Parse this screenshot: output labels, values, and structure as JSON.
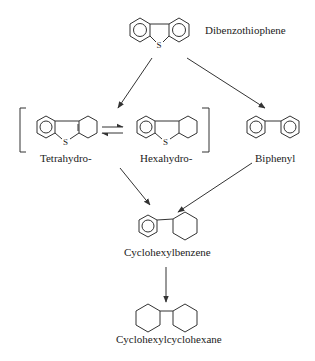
{
  "diagram": {
    "type": "reaction-pathway",
    "compounds": [
      {
        "id": "dbt",
        "label": "Dibenzothiophene"
      },
      {
        "id": "tetrahydro",
        "label": "Tetrahydro-"
      },
      {
        "id": "hexahydro",
        "label": "Hexahydro-"
      },
      {
        "id": "biphenyl",
        "label": "Biphenyl"
      },
      {
        "id": "chb",
        "label": "Cyclohexylbenzene"
      },
      {
        "id": "chch",
        "label": "Cyclohexylcyclohexane"
      }
    ],
    "atom_label": "S",
    "edges": [
      {
        "from": "dbt",
        "to": "tetrahydro-hexahydro-group",
        "type": "arrow"
      },
      {
        "from": "dbt",
        "to": "biphenyl",
        "type": "arrow"
      },
      {
        "from": "tetrahydro",
        "to": "hexahydro",
        "type": "equilibrium"
      },
      {
        "from": "tetrahydro-hexahydro-group",
        "to": "chb",
        "type": "arrow"
      },
      {
        "from": "biphenyl",
        "to": "chb",
        "type": "arrow"
      },
      {
        "from": "chb",
        "to": "chch",
        "type": "arrow"
      }
    ]
  }
}
